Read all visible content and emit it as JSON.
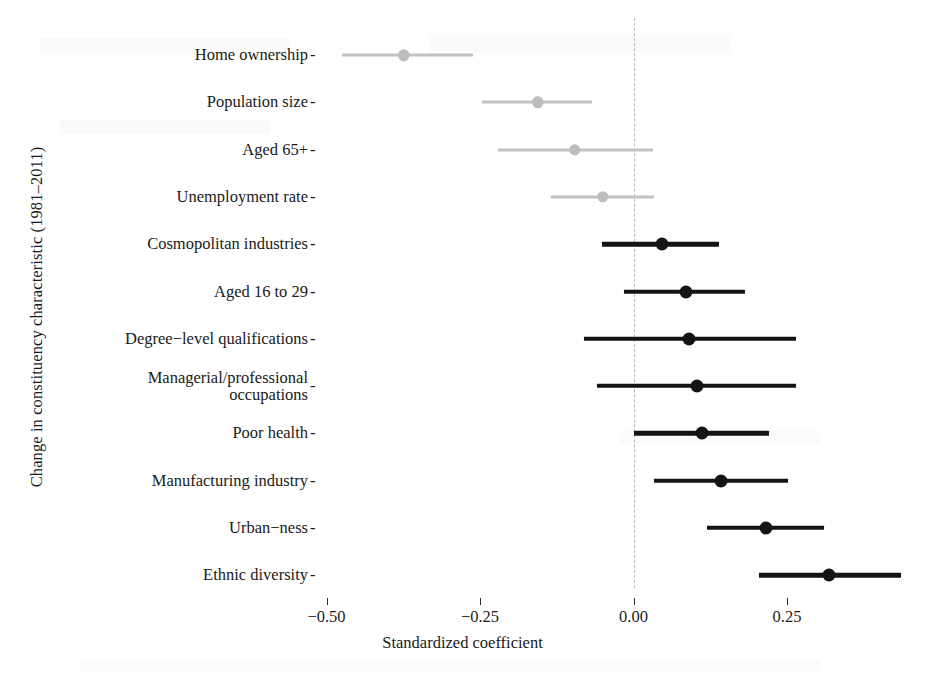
{
  "chart_data": {
    "type": "scatter",
    "title": "",
    "xlabel": "Standardized coefficient",
    "ylabel": "Change in constituency characteristic (1981–2011)",
    "xlim": [
      -0.6,
      0.48
    ],
    "xticks": [
      -0.5,
      -0.25,
      0.0,
      0.25
    ],
    "xtick_labels": [
      "−0.50",
      "−0.25",
      "0.00",
      "0.25"
    ],
    "grid": false,
    "legend": null,
    "zero_reference_line": 0.0,
    "categories": [
      "Home ownership",
      "Population size",
      "Aged 65+",
      "Unemployment rate",
      "Cosmopolitan industries",
      "Aged 16 to 29",
      "Degree−level qualifications",
      "Managerial/professional\noccupations",
      "Poor health",
      "Manufacturing industry",
      "Urban−ness",
      "Ethnic diversity"
    ],
    "points": [
      {
        "label": "Home ownership",
        "estimate": -0.374,
        "ci_low": -0.475,
        "ci_high": -0.262,
        "significant": false
      },
      {
        "label": "Population size",
        "estimate": -0.156,
        "ci_low": -0.246,
        "ci_high": -0.067,
        "significant": false
      },
      {
        "label": "Aged 65+",
        "estimate": -0.096,
        "ci_low": -0.22,
        "ci_high": 0.031,
        "significant": false
      },
      {
        "label": "Unemployment rate",
        "estimate": -0.05,
        "ci_low": -0.135,
        "ci_high": 0.033,
        "significant": false
      },
      {
        "label": "Cosmopolitan industries",
        "estimate": 0.046,
        "ci_low": -0.052,
        "ci_high": 0.14,
        "significant": true
      },
      {
        "label": "Aged 16 to 29",
        "estimate": 0.085,
        "ci_low": -0.016,
        "ci_high": 0.182,
        "significant": true
      },
      {
        "label": "Degree−level qualifications",
        "estimate": 0.091,
        "ci_low": -0.081,
        "ci_high": 0.265,
        "significant": true
      },
      {
        "label": "Managerial/professional\noccupations",
        "estimate": 0.104,
        "ci_low": -0.059,
        "ci_high": 0.265,
        "significant": true
      },
      {
        "label": "Poor health",
        "estimate": 0.111,
        "ci_low": 0.0,
        "ci_high": 0.22,
        "significant": true
      },
      {
        "label": "Manufacturing industry",
        "estimate": 0.142,
        "ci_low": 0.033,
        "ci_high": 0.252,
        "significant": true
      },
      {
        "label": "Urban−ness",
        "estimate": 0.215,
        "ci_low": 0.119,
        "ci_high": 0.31,
        "significant": true
      },
      {
        "label": "Ethnic diversity",
        "estimate": 0.319,
        "ci_low": 0.205,
        "ci_high": 0.435,
        "significant": true
      }
    ],
    "colors": {
      "significant": "#141414",
      "non_significant": "#c2c2c2",
      "zero_line": "#b9b9b9",
      "background": "#ffffff"
    }
  },
  "axis": {
    "y_title": "Change in constituency characteristic (1981–2011)",
    "x_title": "Standardized coefficient",
    "tick_dash": "-"
  }
}
